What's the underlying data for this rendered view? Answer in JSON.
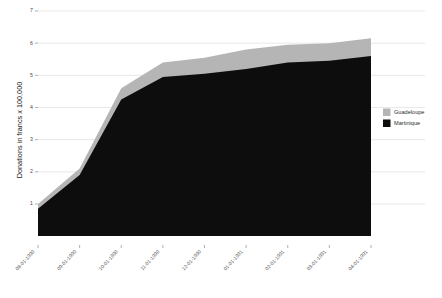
{
  "chart_data": {
    "type": "area",
    "title": "",
    "subtitle": "",
    "xlabel": "",
    "ylabel": "Donations in francs x 100,000",
    "stacked": true,
    "grid": true,
    "legend_position": "right",
    "ylim": [
      0,
      7
    ],
    "yticks": [
      1,
      2,
      3,
      4,
      5,
      6,
      7
    ],
    "ytick_labels": [
      "1",
      "2",
      "3",
      "4",
      "5",
      "6",
      "7"
    ],
    "categories": [
      "08-01-1990",
      "09-01-1990",
      "10-01-1990",
      "11-01-1990",
      "12-01-1990",
      "01-01-1991",
      "02-01-1991",
      "03-01-1991",
      "04-01-1991"
    ],
    "series": [
      {
        "name": "Martinique",
        "color": "#0d0d0d",
        "values": [
          0.85,
          1.9,
          4.25,
          4.95,
          5.05,
          5.2,
          5.4,
          5.45,
          5.6
        ]
      },
      {
        "name": "Guadeloupe",
        "color": "#b5b5b5",
        "values": [
          0.15,
          0.2,
          0.35,
          0.45,
          0.5,
          0.6,
          0.55,
          0.55,
          0.55
        ]
      }
    ],
    "cumulative_totals": [
      1.0,
      2.1,
      4.6,
      5.4,
      5.55,
      5.8,
      5.95,
      6.0,
      6.15
    ]
  },
  "legend": {
    "items": [
      {
        "label": "Guadeloupe",
        "color": "#b5b5b5"
      },
      {
        "label": "Martinique",
        "color": "#0d0d0d"
      }
    ]
  },
  "axes": {
    "y_title": "Donations in francs x 100,000"
  }
}
